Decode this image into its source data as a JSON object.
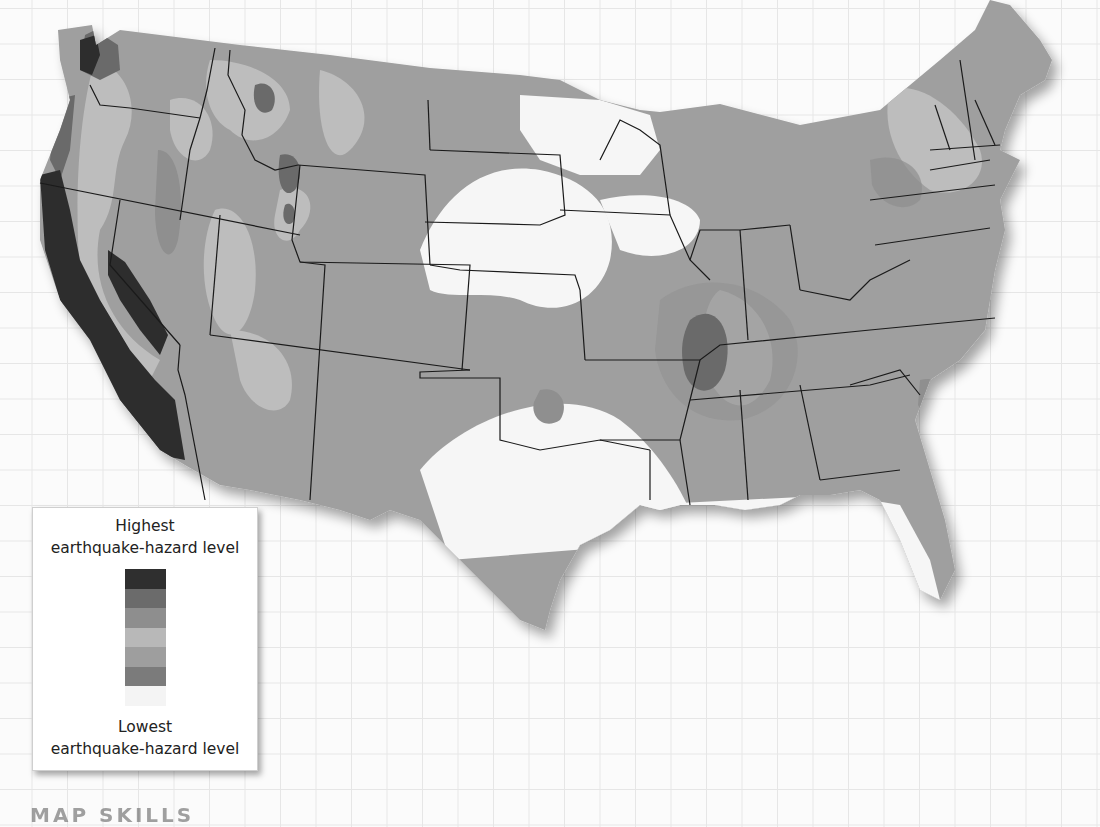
{
  "map": {
    "subject": "Contiguous United States earthquake-hazard map",
    "colors": {
      "background": "#fbfbfb",
      "grid": "#e6e6e6",
      "level_7": "#2d2d2d",
      "level_6": "#6a6a6a",
      "level_5": "#8f8f8f",
      "level_4": "#a8a8a8",
      "level_3": "#bdbdbd",
      "level_2": "#9c9c9c",
      "level_1": "#f6f6f6",
      "state_border": "#1a1a1a"
    }
  },
  "legend": {
    "top_title_line1": "Highest",
    "top_title_line2": "earthquake-hazard level",
    "bottom_title_line1": "Lowest",
    "bottom_title_line2": "earthquake-hazard level",
    "levels": [
      {
        "rank": 7,
        "color": "#2f2f2f"
      },
      {
        "rank": 6,
        "color": "#6b6b6b"
      },
      {
        "rank": 5,
        "color": "#8e8e8e"
      },
      {
        "rank": 4,
        "color": "#b8b8b8"
      },
      {
        "rank": 3,
        "color": "#9e9e9e"
      },
      {
        "rank": 2,
        "color": "#7b7b7b"
      },
      {
        "rank": 1,
        "color": "#f4f4f4"
      }
    ]
  },
  "footer": {
    "heading_partial": "MAP SKILLS"
  }
}
